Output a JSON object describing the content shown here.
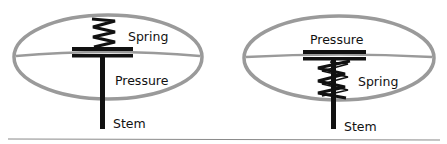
{
  "colors": {
    "ellipse": "#9a9a9a",
    "mechanism": "#111111",
    "divider": "#8a8a8a",
    "background": "#ffffff"
  },
  "diagrams": [
    {
      "id": "left",
      "labels": {
        "spring": "Spring",
        "pressure": "Pressure",
        "stem": "Stem"
      },
      "arrangement": "spring-above-plate"
    },
    {
      "id": "right",
      "labels": {
        "pressure": "Pressure",
        "spring": "Spring",
        "stem": "Stem"
      },
      "arrangement": "spring-below-plate"
    }
  ]
}
